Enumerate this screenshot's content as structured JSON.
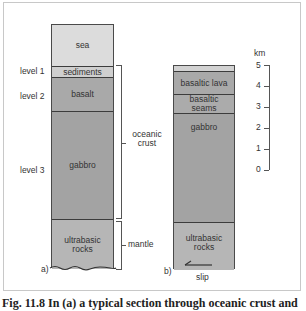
{
  "figure": {
    "caption": "Fig. 11.8 In (a) a typical section through oceanic crust and",
    "panel_a": {
      "label": "a)",
      "layers": [
        {
          "name": "sea",
          "text": "sea",
          "color": "#dcdcdc"
        },
        {
          "name": "sediments",
          "text": "sediments",
          "color": "#cfcfcf"
        },
        {
          "name": "basalt",
          "text": "basalt",
          "color": "#a9a9a9"
        },
        {
          "name": "gabbro",
          "text": "gabbro",
          "color": "#a3a3a3"
        },
        {
          "name": "ultrabasic-rocks",
          "text": "ultrabasic rocks",
          "color": "#b6b6b6"
        }
      ],
      "levels": [
        "level 1",
        "level 2",
        "level 3"
      ],
      "brackets": {
        "crust": "oceanic crust",
        "mantle": "mantle"
      }
    },
    "panel_b": {
      "label": "b)",
      "layers": [
        {
          "name": "top-band",
          "text": "",
          "color": "#d2d2d2"
        },
        {
          "name": "basaltic-lava",
          "text": "basaltic lava",
          "color": "#a9a9a9"
        },
        {
          "name": "basaltic-seams",
          "text": "basaltic seams",
          "color": "#ababab"
        },
        {
          "name": "gabbro",
          "text": "gabbro",
          "color": "#a3a3a3"
        },
        {
          "name": "ultrabasic-rocks",
          "text": "ultrabasic rocks",
          "color": "#b6b6b6"
        }
      ],
      "slip_label": "slip"
    },
    "scale": {
      "unit": "km",
      "ticks": [
        "5",
        "4",
        "3",
        "2",
        "1",
        "0"
      ]
    }
  }
}
